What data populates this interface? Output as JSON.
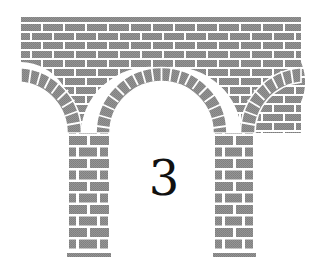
{
  "figure": {
    "label": "3",
    "colors": {
      "brick": "#8c8c8c",
      "brick_dark": "#7a7a7a",
      "mortar": "#ffffff",
      "background": "#ffffff",
      "label": "#111111"
    },
    "geometry": {
      "deck": {
        "x": 21,
        "y": 17,
        "width": 280,
        "height": 50
      },
      "left_pier": {
        "x": 67,
        "y": 133,
        "width": 44,
        "height": 120
      },
      "right_pier": {
        "x": 213,
        "y": 133,
        "width": 42,
        "height": 120
      },
      "arch_radius": 51,
      "voussoir_thickness": 14
    }
  }
}
